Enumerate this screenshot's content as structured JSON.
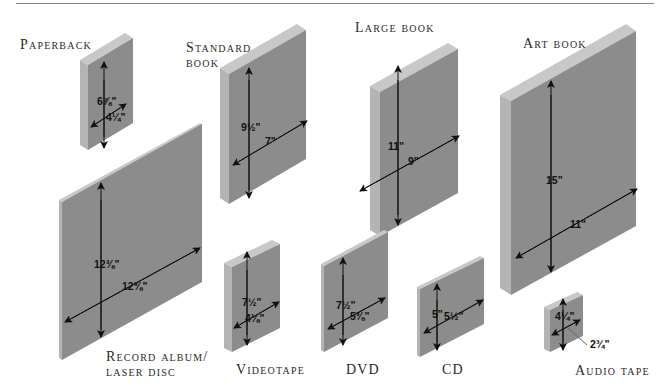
{
  "colors": {
    "face": "#8c8c8c",
    "edge_side": "#b4b4b4",
    "edge_top": "#c8c8c8",
    "arrow": "#111111",
    "rule": "#8a8a8a"
  },
  "items": [
    {
      "id": "paperback",
      "label": "Paperback",
      "height": "6⅞\"",
      "width": "4¼\""
    },
    {
      "id": "standard-book",
      "label": "Standard",
      "label_line2": "book",
      "height": "9½\"",
      "width": "7\""
    },
    {
      "id": "large-book",
      "label": "Large book",
      "height": "11\"",
      "width": "9\""
    },
    {
      "id": "art-book",
      "label": "Art book",
      "height": "15\"",
      "width": "11\""
    },
    {
      "id": "record-album",
      "label": "Record album/",
      "label_line2": "laser disc",
      "height": "12⅜\"",
      "width": "12⅜\""
    },
    {
      "id": "videotape",
      "label": "Videotape",
      "height": "7½\"",
      "width": "4⅛\""
    },
    {
      "id": "dvd",
      "label": "DVD",
      "height": "7½\"",
      "width": "5⅜\""
    },
    {
      "id": "cd",
      "label": "CD",
      "height": "5\"",
      "width": "5½\""
    },
    {
      "id": "audio-tape",
      "label": "Audio tape",
      "height": "4¼\"",
      "width": "2¾\""
    }
  ]
}
